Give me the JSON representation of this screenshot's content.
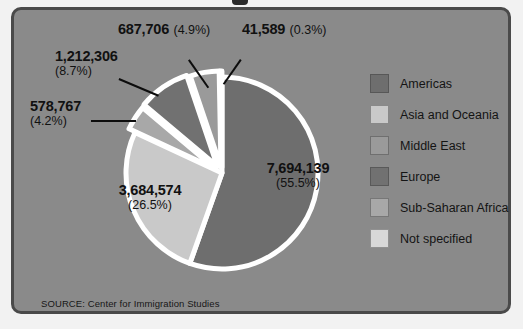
{
  "panel": {
    "background_color": "#8a8a8a",
    "border_color": "#4a4a4a",
    "source_note": "SOURCE: Center for Immigration Studies"
  },
  "legend": {
    "position": "right",
    "items": [
      {
        "label": "Americas",
        "color": "#6e6e6e"
      },
      {
        "label": "Asia and Oceania",
        "color": "#c9c9c9"
      },
      {
        "label": "Middle East",
        "color": "#9a9a9a"
      },
      {
        "label": "Europe",
        "color": "#717171"
      },
      {
        "label": "Sub-Saharan Africa",
        "color": "#a8a8a8"
      },
      {
        "label": "Not specified",
        "color": "#d8d8d8"
      }
    ]
  },
  "callouts": {
    "middle_east": {
      "value": "687,706",
      "percent": "(4.9%)"
    },
    "not_specified": {
      "value": "41,589",
      "percent": "(0.3%)"
    },
    "europe": {
      "value": "1,212,306",
      "percent": "(8.7%)"
    },
    "sub_saharan": {
      "value": "578,767",
      "percent": "(4.2%)"
    },
    "asia": {
      "value": "3,684,574",
      "percent": "(26.5%)"
    },
    "americas": {
      "value": "7,694,139",
      "percent": "(55.5%)"
    }
  },
  "chart_data": {
    "type": "pie",
    "title": "",
    "labels": [
      "Americas",
      "Asia and Oceania",
      "Sub-Saharan Africa",
      "Europe",
      "Middle East",
      "Not specified"
    ],
    "values": [
      7694139,
      3684574,
      578767,
      1212306,
      687706,
      41589
    ],
    "percents": [
      55.5,
      26.5,
      4.2,
      8.7,
      4.9,
      0.3
    ],
    "value_labels": [
      "7,694,139",
      "3,684,574",
      "578,767",
      "1,212,306",
      "687,706",
      "41,589"
    ],
    "percent_labels": [
      "(55.5%)",
      "(26.5%)",
      "(4.2%)",
      "(8.7%)",
      "(4.9%)",
      "(0.3%)"
    ],
    "colors": [
      "#6e6e6e",
      "#c9c9c9",
      "#a8a8a8",
      "#717171",
      "#9a9a9a",
      "#d8d8d8"
    ],
    "slice_separator_color": "#ffffff",
    "start_angle_deg": 0,
    "direction": "clockwise",
    "total": 13899041,
    "legend_position": "right",
    "grid": false,
    "source": "SOURCE: Center for Immigration Studies"
  }
}
